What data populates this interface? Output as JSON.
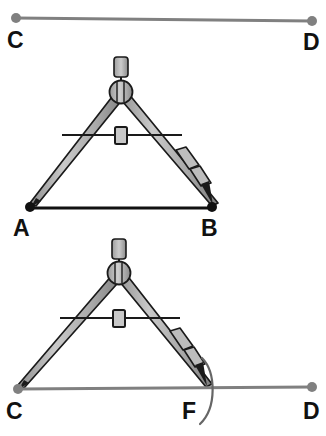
{
  "figure": {
    "background_color": "#ffffff",
    "width": 326,
    "height": 436
  },
  "colors": {
    "segment_given": "#111111",
    "segment_target": "#808080",
    "point_given": "#111111",
    "point_target": "#808080",
    "compass_fill": "#b3b3b3",
    "compass_stroke": "#1a1a1a",
    "arc": "#666666",
    "label": "#111111"
  },
  "panels": [
    {
      "name": "top-ray",
      "description": "Gray ray from C to D with round endpoints",
      "segment": {
        "name": "segment-CD-top",
        "x1": 16,
        "y1": 18,
        "x2": 312,
        "y2": 21,
        "color": "#808080",
        "stroke_width": 3
      },
      "points": [
        {
          "name": "point-C-top",
          "label": "C",
          "cx": 16,
          "cy": 18,
          "r": 5,
          "color": "#808080",
          "label_x": 7,
          "label_y": 48
        },
        {
          "name": "point-D-top",
          "label": "D",
          "cx": 312,
          "cy": 21,
          "r": 5,
          "color": "#808080",
          "label_x": 303,
          "label_y": 50
        }
      ]
    },
    {
      "name": "middle-compass-on-AB",
      "description": "Compass opened to match given segment AB; needle at A, pencil at B",
      "segment": {
        "name": "segment-AB",
        "x1": 30,
        "y1": 208,
        "x2": 213,
        "y2": 208,
        "color": "#111111",
        "stroke_width": 3
      },
      "points": [
        {
          "name": "point-A",
          "label": "A",
          "cx": 30,
          "cy": 207,
          "r": 5,
          "color": "#111111",
          "label_x": 13,
          "label_y": 236
        },
        {
          "name": "point-B",
          "label": "B",
          "cx": 212,
          "cy": 207,
          "r": 5,
          "color": "#111111",
          "label_x": 201,
          "label_y": 236
        }
      ],
      "compass": {
        "name": "compass-measuring-AB",
        "hinge_x": 121,
        "hinge_y": 92,
        "handle_top_y": 58,
        "needle_x": 30,
        "needle_y": 207,
        "pencil_x": 212,
        "pencil_y": 207,
        "crossbar_y": 135,
        "crossbar_x1": 62,
        "crossbar_x2": 182
      }
    },
    {
      "name": "bottom-compass-on-CD",
      "description": "Same compass opening transferred to ray CD, marking point F with an arc",
      "segment": {
        "name": "segment-CD-bottom",
        "x1": 18,
        "y1": 389,
        "x2": 312,
        "y2": 387,
        "color": "#808080",
        "stroke_width": 3
      },
      "points": [
        {
          "name": "point-C-bottom",
          "label": "C",
          "cx": 18,
          "cy": 389,
          "r": 5,
          "color": "#808080",
          "label_x": 6,
          "label_y": 419
        },
        {
          "name": "point-F",
          "label": "F",
          "cx": 206,
          "cy": 388,
          "r": 0,
          "color": "#808080",
          "label_x": 182,
          "label_y": 419
        },
        {
          "name": "point-D-bottom",
          "label": "D",
          "cx": 312,
          "cy": 387,
          "r": 5,
          "color": "#808080",
          "label_x": 303,
          "label_y": 419
        }
      ],
      "compass": {
        "name": "compass-transferring-to-CD",
        "hinge_x": 119,
        "hinge_y": 273,
        "handle_top_y": 240,
        "needle_x": 18,
        "needle_y": 389,
        "pencil_x": 206,
        "pencil_y": 388,
        "crossbar_y": 318,
        "crossbar_x1": 60,
        "crossbar_x2": 180
      },
      "arc": {
        "name": "construction-arc-at-F",
        "description": "Pencil arc crossing ray CD at F",
        "color": "#666666",
        "stroke_width": 2.2,
        "start_x": 202,
        "start_y": 358,
        "end_x": 200,
        "end_y": 424,
        "bulge_x": 218,
        "bulge_y": 391
      }
    }
  ],
  "labels": {
    "C_top": "C",
    "D_top": "D",
    "A": "A",
    "B": "B",
    "C_bottom": "C",
    "F": "F",
    "D_bottom": "D"
  }
}
